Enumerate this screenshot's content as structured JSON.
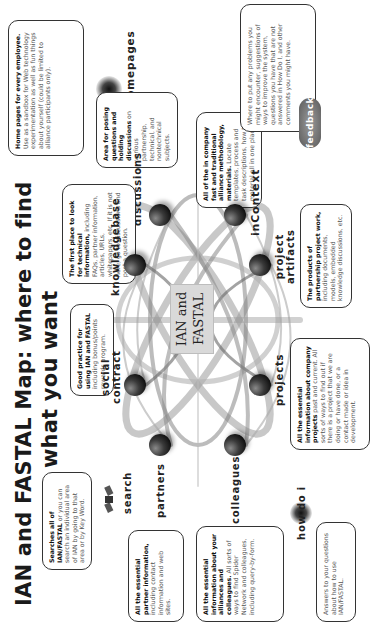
{
  "title": {
    "line1": "IAN and FASTAL Map:  where to find",
    "line2": "what you want"
  },
  "center": {
    "line1": "IAN and",
    "line2": "FASTAL"
  },
  "nodes": {
    "homepages": {
      "label": "homepages",
      "desc_bold": "Home pages for every employee.",
      "desc": " Use as a sandbox for Web technology experimentation as well as fun things about yourself (could be limited to alliance participants only)."
    },
    "discussions": {
      "label": "discussions",
      "desc_bold": "Area for posing questions and holding discussions",
      "desc": " on various partnership, technical, and nontechnical subjects."
    },
    "knowledgebase": {
      "label": "knowledgebase",
      "desc_bold": "The first place to look for technical information,",
      "desc": " including FAQs, partner information, articles, URLs, whitepapers, etc. If it is not here, go to discussions and post a question."
    },
    "incontext": {
      "label": "inContext",
      "desc_bold": "All of the in company fast and traditional alliance methodology, materials.",
      "desc": " Locate templates, process and task descriptions, how to material all in one place."
    },
    "feedback": {
      "label": "feedback",
      "desc": "Where to put any problems you might encounter, suggestions of ways to improve the system, questions you have that are not answered in How Do I, and other comments you might have."
    },
    "project_artifacts": {
      "label_line1": "project",
      "label_line2": "artifacts",
      "desc_bold": "The products of partnership project work,",
      "desc": " including documents, models, embedded knowledge discussions, etc."
    },
    "social_contract": {
      "label_line1": "social",
      "label_line2": "contract",
      "desc_bold": "Good practice for using IAN and FASTAL",
      "desc": " including bonus/points rewards program."
    },
    "projects": {
      "label": "projects",
      "desc_bold": "All the essential information about company projects",
      "desc": " past and current.  All sorts of ways to find out if there is a project that we are doing or have done, or a contact made or idea in development."
    },
    "search": {
      "label": "search",
      "desc_bold": "Searches all of IAN/FASTAL",
      "desc": " or you can search an individual area of IAN by going to that area or by Key Word."
    },
    "partners": {
      "label": "partners",
      "desc_bold": "All the essential partner information,",
      "desc": " including contact information and web sites."
    },
    "colleagues": {
      "label": "colleagues",
      "desc_bold": "All the essential information about your alliances and colleagues.",
      "desc": " All sorts of ways to find Spider Network and colleagues, including query-by-form."
    },
    "howdoi": {
      "label": "how do i",
      "desc": "Answers to your questions about how to use IAN/FASTAL."
    }
  }
}
